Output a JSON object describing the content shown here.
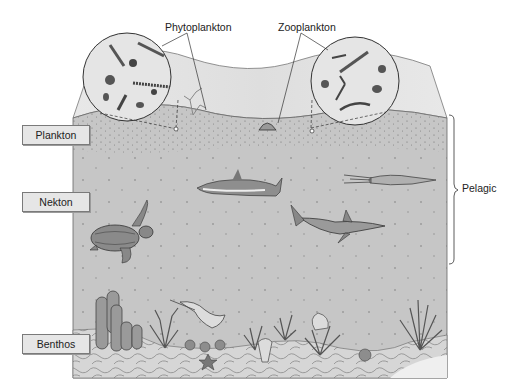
{
  "diagram": {
    "type": "marine-life-zones",
    "labels": {
      "plankton": "Plankton",
      "nekton": "Nekton",
      "benthos": "Benthos",
      "pelagic": "Pelagic",
      "phytoplankton": "Phytoplankton",
      "zooplankton": "Zooplankton"
    },
    "zones": [
      {
        "name": "Plankton",
        "group": "Pelagic",
        "examples": [
          "phytoplankton",
          "zooplankton",
          "jellyfish"
        ]
      },
      {
        "name": "Nekton",
        "group": "Pelagic",
        "examples": [
          "dolphin",
          "squid",
          "sea turtle",
          "shark"
        ]
      },
      {
        "name": "Benthos",
        "group": "",
        "examples": [
          "tube sponges",
          "coral",
          "stingray",
          "sea star",
          "sea fan",
          "anemone"
        ]
      }
    ],
    "colors": {
      "water": "#c6c6c6",
      "surface_slab": "#e4e4e4",
      "seafloor": "#d4d4d4",
      "outline": "#555555",
      "label_fill": "#e6e6e6"
    }
  }
}
